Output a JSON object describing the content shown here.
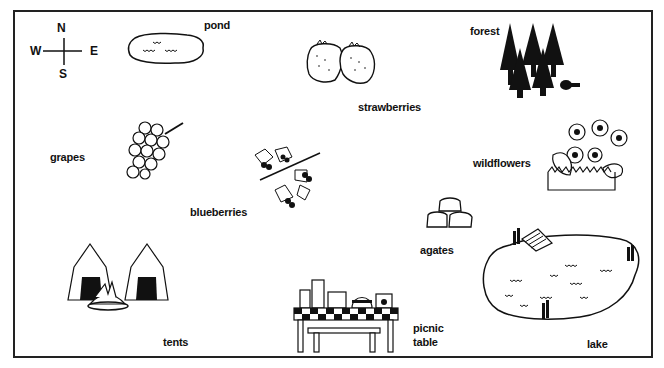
{
  "compass": {
    "north": "N",
    "south": "S",
    "east": "E",
    "west": "W"
  },
  "landmarks": {
    "pond": "pond",
    "strawberries": "strawberries",
    "forest": "forest",
    "grapes": "grapes",
    "blueberries": "blueberries",
    "wildflowers": "wildflowers",
    "agates": "agates",
    "tents": "tents",
    "picnic_table_line1": "picnic",
    "picnic_table_line2": "table",
    "lake": "lake"
  },
  "colors": {
    "ink": "#111111",
    "background": "#ffffff",
    "border": "#222222"
  }
}
